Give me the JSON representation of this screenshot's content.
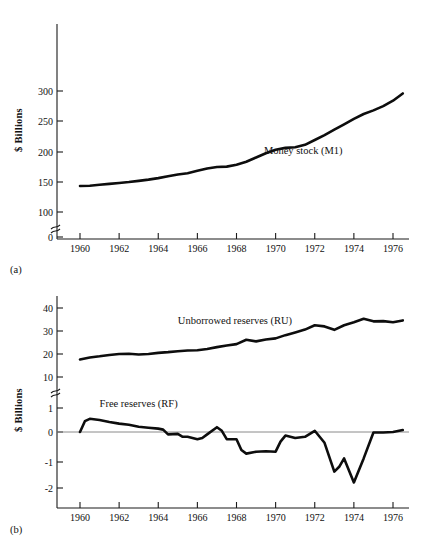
{
  "figure": {
    "background": "#ffffff",
    "ink_color": "#0d0d0d",
    "axis_color": "#1a1a1a",
    "zero_line_color": "#8a8a8a"
  },
  "panels": [
    {
      "id": "a",
      "panel_label": "(a)",
      "ylabel": "$ Billions"
    },
    {
      "id": "b",
      "panel_label": "(b)",
      "ylabel": "$ Billions"
    }
  ],
  "chart_data": [
    {
      "type": "line",
      "title": "",
      "panel": "(a)",
      "xlabel": "",
      "ylabel": "$ Billions",
      "xlim": [
        1959.4,
        1977.0
      ],
      "ylim": [
        0,
        325
      ],
      "grid": false,
      "legend_position": "inline-annotation",
      "axis_break": {
        "between": [
          0,
          100
        ],
        "axis": "y"
      },
      "xticks": [
        1960,
        1962,
        1964,
        1966,
        1968,
        1970,
        1972,
        1974,
        1976
      ],
      "xticklabels": [
        "1960",
        "1962",
        "1964",
        "1966",
        "1968",
        "1970",
        "1972",
        "1974",
        "1976"
      ],
      "yticks": [
        0,
        100,
        150,
        200,
        250,
        300
      ],
      "yticklabels": [
        "0",
        "100",
        "150",
        "200",
        "250",
        "300"
      ],
      "series": [
        {
          "name": "Money stock (M1)",
          "annotation": "Money stock (M1)",
          "annotation_x": 1969.4,
          "annotation_y": 196,
          "x": [
            1960.0,
            1960.5,
            1961.0,
            1961.5,
            1962.0,
            1962.5,
            1963.0,
            1963.5,
            1964.0,
            1964.5,
            1965.0,
            1965.5,
            1966.0,
            1966.5,
            1967.0,
            1967.5,
            1968.0,
            1968.5,
            1969.0,
            1969.5,
            1970.0,
            1970.5,
            1971.0,
            1971.5,
            1972.0,
            1972.5,
            1973.0,
            1973.5,
            1974.0,
            1974.5,
            1975.0,
            1975.5,
            1976.0,
            1976.5
          ],
          "y": [
            143.0,
            143.5,
            145.0,
            146.5,
            148.0,
            149.5,
            151.5,
            153.5,
            156.0,
            159.0,
            162.0,
            164.0,
            168.0,
            172.0,
            174.5,
            175.0,
            178.0,
            183.0,
            190.0,
            197.0,
            203.0,
            206.0,
            207.0,
            211.0,
            219.0,
            227.0,
            236.0,
            245.0,
            254.0,
            262.0,
            268.0,
            275.0,
            284.0,
            296.0
          ]
        }
      ]
    },
    {
      "type": "line",
      "title": "",
      "panel": "(b)",
      "xlabel": "",
      "ylabel": "$ Billions",
      "xlim": [
        1959.4,
        1977.0
      ],
      "grid": false,
      "legend_position": "inline-annotation",
      "axis_break": {
        "between": [
          1,
          10
        ],
        "axis": "y"
      },
      "xticks": [
        1960,
        1962,
        1964,
        1966,
        1968,
        1970,
        1972,
        1974,
        1976
      ],
      "xticklabels": [
        "1960",
        "1962",
        "1964",
        "1966",
        "1968",
        "1970",
        "1972",
        "1974",
        "1976"
      ],
      "upper_segment": {
        "ylim": [
          10,
          45
        ],
        "yticks": [
          10,
          20,
          30,
          40
        ],
        "yticklabels": [
          "10",
          "20",
          "30",
          "40"
        ]
      },
      "lower_segment": {
        "ylim": [
          -2.7,
          1.4
        ],
        "yticks": [
          1,
          0,
          -1,
          -2
        ],
        "yticklabels": [
          "1",
          "0",
          "-1",
          "-2"
        ]
      },
      "zero_reference_line": 0,
      "series": [
        {
          "name": "Unborrowed reserves (RU)",
          "annotation": "Unborrowed reserves (RU)",
          "annotation_x": 1965.0,
          "annotation_y": 33.0,
          "segment": "upper",
          "x": [
            1960.0,
            1960.5,
            1961.0,
            1961.5,
            1962.0,
            1962.5,
            1963.0,
            1963.5,
            1964.0,
            1964.5,
            1965.0,
            1965.5,
            1966.0,
            1966.5,
            1967.0,
            1967.5,
            1968.0,
            1968.5,
            1969.0,
            1969.5,
            1970.0,
            1970.5,
            1971.0,
            1971.5,
            1972.0,
            1972.5,
            1973.0,
            1973.5,
            1974.0,
            1974.5,
            1975.0,
            1975.5,
            1976.0,
            1976.5
          ],
          "y": [
            17.6,
            18.5,
            19.0,
            19.6,
            20.0,
            20.1,
            19.8,
            20.0,
            20.5,
            20.8,
            21.2,
            21.5,
            21.6,
            22.2,
            23.0,
            23.7,
            24.3,
            26.2,
            25.5,
            26.3,
            26.8,
            28.2,
            29.4,
            30.6,
            32.5,
            32.0,
            30.5,
            32.5,
            33.8,
            35.3,
            34.2,
            34.3,
            33.8,
            34.6
          ]
        },
        {
          "name": "Free reserves (RF)",
          "annotation": "Free reserves (RF)",
          "annotation_x": 1961.0,
          "annotation_y": 1.05,
          "segment": "lower",
          "x": [
            1960.0,
            1960.25,
            1960.5,
            1961.0,
            1961.5,
            1962.0,
            1962.5,
            1963.0,
            1963.5,
            1964.0,
            1964.25,
            1964.5,
            1965.0,
            1965.25,
            1965.5,
            1966.0,
            1966.25,
            1966.5,
            1967.0,
            1967.25,
            1967.5,
            1968.0,
            1968.25,
            1968.5,
            1969.0,
            1969.5,
            1970.0,
            1970.25,
            1970.5,
            1971.0,
            1971.5,
            1972.0,
            1972.5,
            1973.0,
            1973.25,
            1973.5,
            1973.75,
            1974.0,
            1974.5,
            1975.0,
            1975.5,
            1976.0,
            1976.5
          ],
          "y": [
            0.0,
            0.45,
            0.55,
            0.5,
            0.42,
            0.35,
            0.3,
            0.22,
            0.18,
            0.14,
            0.1,
            -0.1,
            -0.08,
            -0.2,
            -0.2,
            -0.3,
            -0.25,
            -0.1,
            0.2,
            0.05,
            -0.3,
            -0.3,
            -0.75,
            -0.9,
            -0.82,
            -0.8,
            -0.82,
            -0.4,
            -0.15,
            -0.25,
            -0.2,
            0.05,
            -0.45,
            -1.65,
            -1.45,
            -1.1,
            -1.6,
            -2.1,
            -1.1,
            -0.02,
            -0.02,
            0.0,
            0.08
          ]
        }
      ]
    }
  ]
}
